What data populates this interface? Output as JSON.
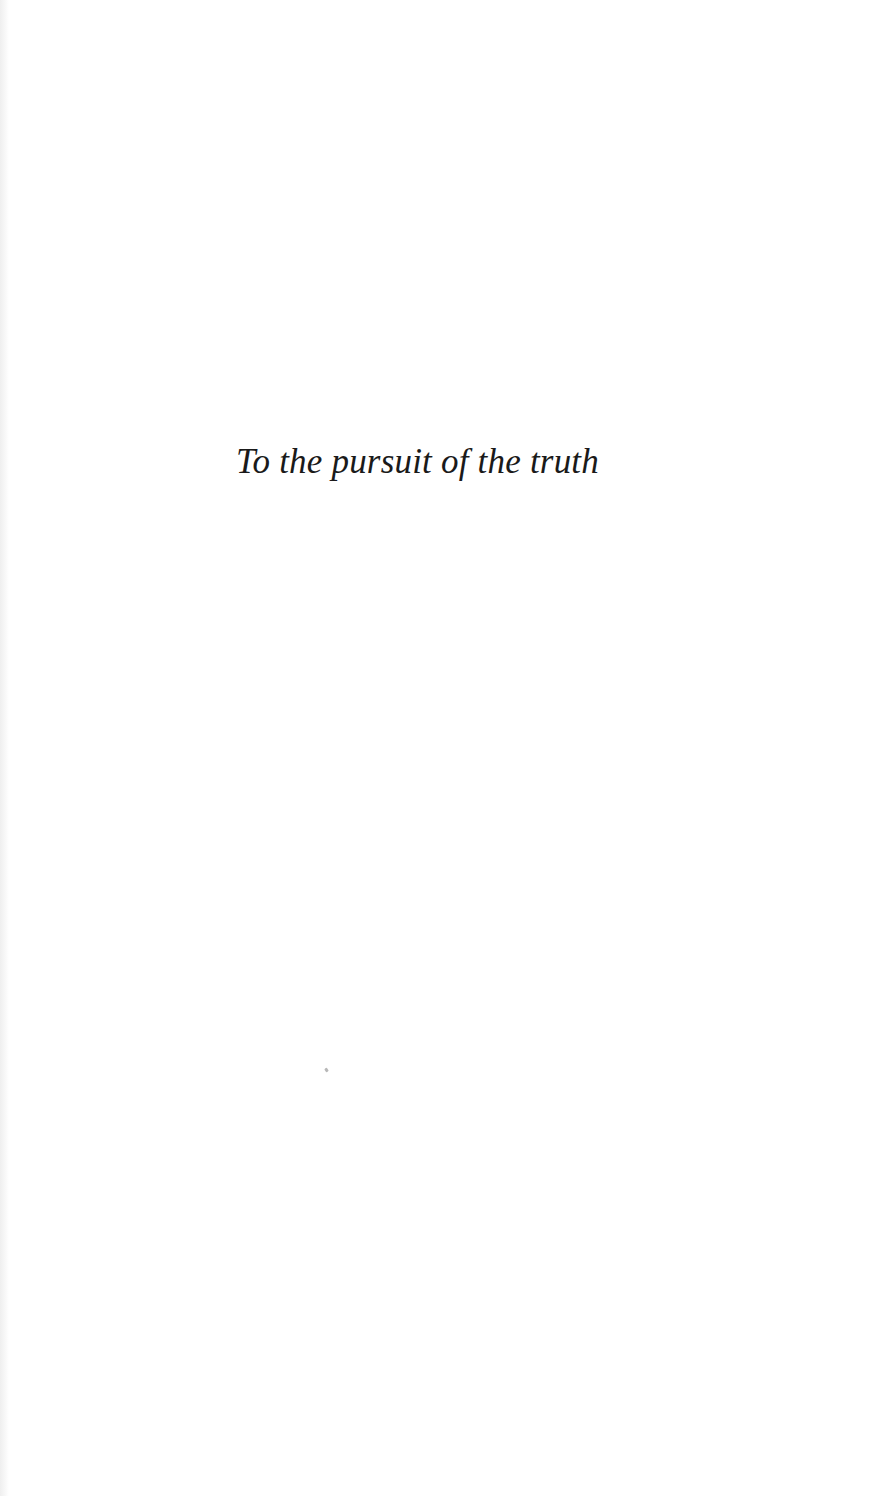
{
  "page": {
    "type": "dedication-page",
    "dedication_text": "To the pursuit of the truth",
    "background_color": "#ffffff",
    "text_color": "#1a1a1a"
  }
}
